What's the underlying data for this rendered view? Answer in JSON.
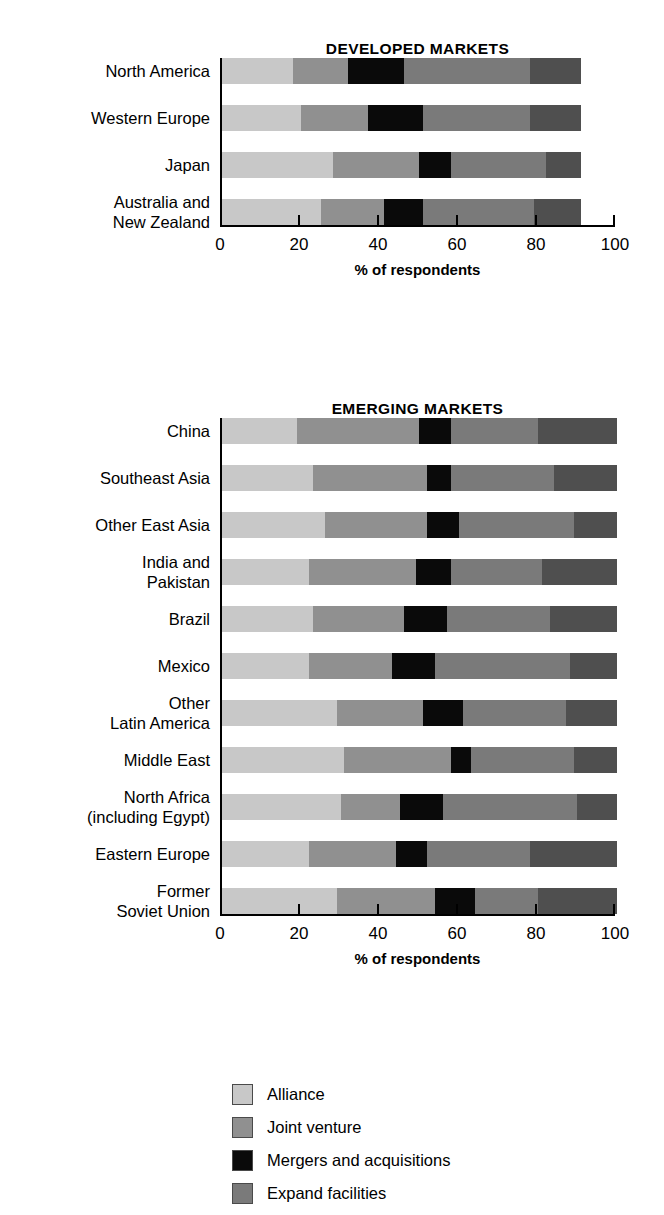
{
  "figure": {
    "axis_title": "% of respondents"
  },
  "panels": [
    {
      "id": "developed",
      "title": "DEVELOPED MARKETS"
    },
    {
      "id": "emerging",
      "title": "EMERGING MARKETS"
    }
  ],
  "legend": {
    "items": [
      {
        "label": "Alliance",
        "color": "#c8c8c8"
      },
      {
        "label": "Joint venture",
        "color": "#909090"
      },
      {
        "label": "Mergers and acquisitions",
        "color": "#0a0a0a"
      },
      {
        "label": "Expand facilities",
        "color": "#7a7a7a"
      }
    ]
  },
  "colors": {
    "alliance": "#c8c8c8",
    "joint_venture": "#909090",
    "mergers": "#0a0a0a",
    "expand": "#7a7a7a",
    "other": "#4f4f4f"
  },
  "chart_data": [
    {
      "type": "bar",
      "orientation": "horizontal",
      "stacked": true,
      "title": "DEVELOPED MARKETS",
      "xlabel": "% of respondents",
      "ylabel": "",
      "xlim": [
        0,
        100
      ],
      "xticks": [
        0,
        20,
        40,
        60,
        80,
        100
      ],
      "ticklabels": [
        "0",
        "20",
        "40",
        "60",
        "80",
        "100"
      ],
      "grid": false,
      "legend_position": "bottom",
      "categories": [
        "North America",
        "Western Europe",
        "Japan",
        "Australia and\nNew Zealand"
      ],
      "series": [
        {
          "name": "Alliance",
          "values": [
            18,
            20,
            28,
            25
          ]
        },
        {
          "name": "Joint venture",
          "values": [
            14,
            17,
            22,
            16
          ]
        },
        {
          "name": "Mergers and acquisitions",
          "values": [
            14,
            14,
            8,
            10
          ]
        },
        {
          "name": "Expand facilities",
          "values": [
            32,
            27,
            24,
            28
          ]
        },
        {
          "name": "Other",
          "values": [
            13,
            13,
            9,
            12
          ]
        }
      ]
    },
    {
      "type": "bar",
      "orientation": "horizontal",
      "stacked": true,
      "title": "EMERGING MARKETS",
      "xlabel": "% of respondents",
      "ylabel": "",
      "xlim": [
        0,
        100
      ],
      "xticks": [
        0,
        20,
        40,
        60,
        80,
        100
      ],
      "ticklabels": [
        "0",
        "20",
        "40",
        "60",
        "80",
        "100"
      ],
      "grid": false,
      "legend_position": "bottom",
      "categories": [
        "China",
        "Southeast Asia",
        "Other East Asia",
        "India and\nPakistan",
        "Brazil",
        "Mexico",
        "Other\nLatin America",
        "Middle East",
        "North Africa\n(including Egypt)",
        "Eastern Europe",
        "Former\nSoviet Union"
      ],
      "series": [
        {
          "name": "Alliance",
          "values": [
            19,
            23,
            26,
            22,
            23,
            22,
            29,
            31,
            30,
            22,
            29
          ]
        },
        {
          "name": "Joint venture",
          "values": [
            31,
            29,
            26,
            27,
            23,
            21,
            22,
            27,
            15,
            22,
            25
          ]
        },
        {
          "name": "Mergers and acquisitions",
          "values": [
            8,
            6,
            8,
            9,
            11,
            11,
            10,
            5,
            11,
            8,
            10
          ]
        },
        {
          "name": "Expand facilities",
          "values": [
            22,
            26,
            29,
            23,
            26,
            34,
            26,
            26,
            34,
            26,
            16
          ]
        },
        {
          "name": "Other",
          "values": [
            20,
            16,
            11,
            19,
            17,
            12,
            13,
            11,
            10,
            22,
            20
          ]
        }
      ]
    }
  ]
}
